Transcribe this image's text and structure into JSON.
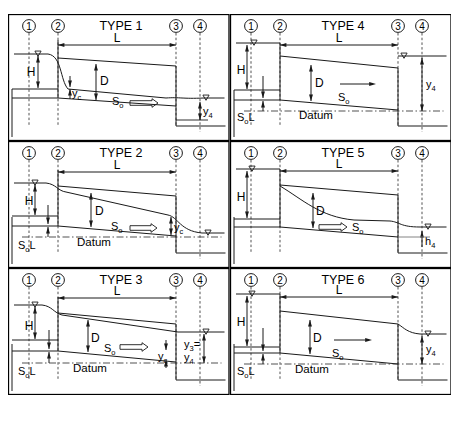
{
  "figure": {
    "title_visible": false,
    "caption": "",
    "colors": {
      "stroke": "#1a1a1a",
      "dashed": "#333333",
      "background": "#ffffff",
      "frame": "#000000"
    },
    "section_markers": [
      "1",
      "2",
      "3",
      "4"
    ],
    "water_surface_symbol": "▽",
    "flow_arrow_symbol": "⇒"
  },
  "panels": [
    {
      "id": "type-1",
      "title": "TYPE 1",
      "row": 0,
      "col": 0,
      "labels": {
        "H": "H",
        "L": "L",
        "D": "D",
        "slope": "S",
        "slope_sub": "o",
        "inlet_depth": "y",
        "inlet_depth_sub": "c",
        "outlet_depth": "y",
        "outlet_depth_sub": "4"
      },
      "has_datum": false,
      "has_sol": false,
      "features": [
        "drawdown-at-inlet",
        "critical-depth-inlet",
        "tailwater-rise-outlet"
      ]
    },
    {
      "id": "type-4",
      "title": "TYPE 4",
      "row": 0,
      "col": 1,
      "labels": {
        "H": "H",
        "L": "L",
        "D": "D",
        "slope": "S",
        "slope_sub": "o",
        "outlet_depth": "y",
        "outlet_depth_sub": "4",
        "datum": "Datum",
        "sol": "S",
        "sol_sub": "o",
        "sol_tail": "L"
      },
      "has_datum": true,
      "has_sol": true,
      "features": [
        "full-flow",
        "submerged-outlet"
      ]
    },
    {
      "id": "type-2",
      "title": "TYPE 2",
      "row": 1,
      "col": 0,
      "labels": {
        "H": "H",
        "L": "L",
        "D": "D",
        "slope": "S",
        "slope_sub": "o",
        "outlet_depth": "y",
        "outlet_depth_sub": "c",
        "datum": "Datum",
        "sol": "S",
        "sol_sub": "o",
        "sol_tail": "L"
      },
      "has_datum": true,
      "has_sol": true,
      "features": [
        "critical-depth-outlet",
        "drawdown-at-outlet"
      ]
    },
    {
      "id": "type-5",
      "title": "TYPE 5",
      "row": 1,
      "col": 1,
      "labels": {
        "H": "H",
        "L": "L",
        "D": "D",
        "slope": "S",
        "slope_sub": "o",
        "outlet_depth": "h",
        "outlet_depth_sub": "4"
      },
      "has_datum": false,
      "has_sol": false,
      "features": [
        "rapid-flow-at-inlet",
        "steep-drawdown"
      ]
    },
    {
      "id": "type-3",
      "title": "TYPE 3",
      "row": 2,
      "col": 0,
      "labels": {
        "H": "H",
        "L": "L",
        "D": "D",
        "slope": "S",
        "slope_sub": "o",
        "critical": "y",
        "critical_sub": "c",
        "outlet_eq_top": "y",
        "outlet_eq_top_sub": "3",
        "outlet_eq_top_tail": "=",
        "outlet_eq_bottom": "y",
        "outlet_eq_bottom_sub": "4",
        "datum": "Datum",
        "sol": "S",
        "sol_sub": "o",
        "sol_tail": "L"
      },
      "has_datum": true,
      "has_sol": true,
      "features": [
        "tranquil-flow",
        "y3-equals-y4"
      ]
    },
    {
      "id": "type-6",
      "title": "TYPE 6",
      "row": 2,
      "col": 1,
      "labels": {
        "H": "H",
        "L": "L",
        "D": "D",
        "slope": "S",
        "slope_sub": "o",
        "outlet_depth": "y",
        "outlet_depth_sub": "4",
        "datum": "Datum",
        "sol": "S",
        "sol_sub": "o",
        "sol_tail": "L"
      },
      "has_datum": true,
      "has_sol": true,
      "features": [
        "full-flow-free-outfall"
      ]
    }
  ]
}
